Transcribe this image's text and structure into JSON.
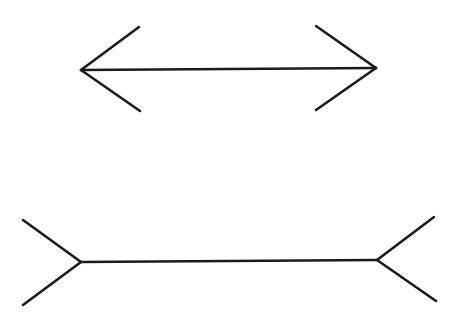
{
  "figure": {
    "name": "Müller-Lyer illusion",
    "background": "#ffffff",
    "stroke_color": "#1a1a1a",
    "figures": [
      {
        "id": "arrows-inward",
        "description": "line with outward-pointing arrowheads (fins converge at ends)",
        "shaft": [
          [
            81,
            70
          ],
          [
            376,
            68
          ]
        ],
        "fins": [
          [
            [
              81,
              70
            ],
            [
              139,
              27
            ]
          ],
          [
            [
              81,
              70
            ],
            [
              140,
              111
            ]
          ],
          [
            [
              376,
              68
            ],
            [
              316,
              26
            ]
          ],
          [
            [
              376,
              68
            ],
            [
              316,
              110
            ]
          ]
        ]
      },
      {
        "id": "arrows-outward",
        "description": "line with inward fins (fins diverge at ends)",
        "shaft": [
          [
            81,
            262
          ],
          [
            377,
            260
          ]
        ],
        "fins": [
          [
            [
              81,
              262
            ],
            [
              23,
              220
            ]
          ],
          [
            [
              81,
              262
            ],
            [
              23,
              305
            ]
          ],
          [
            [
              377,
              260
            ],
            [
              434,
              217
            ]
          ],
          [
            [
              377,
              260
            ],
            [
              436,
              301
            ]
          ]
        ]
      }
    ]
  }
}
